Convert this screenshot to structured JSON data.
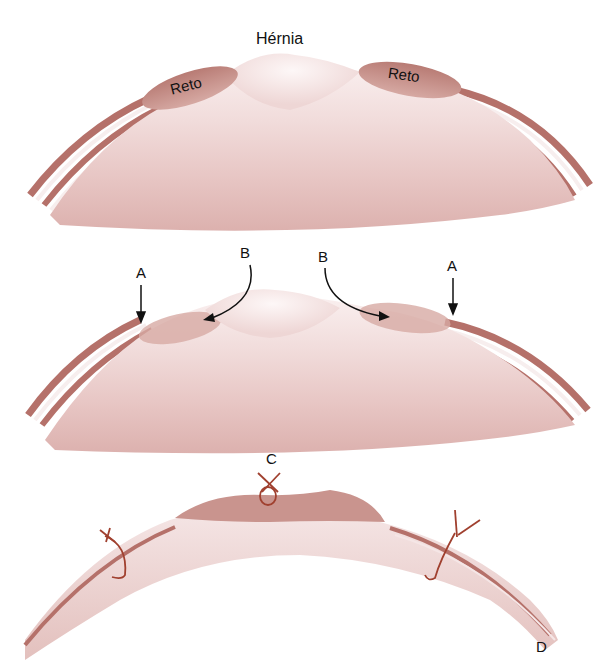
{
  "figure": {
    "panels": [
      {
        "id": "top",
        "description": "Abdominal wall cross-section with hernia between rectus muscles",
        "labels": {
          "title": "Hérnia",
          "left_muscle": "Reto",
          "right_muscle": "Reto"
        }
      },
      {
        "id": "middle",
        "description": "Incision points and rectus muscle displacement",
        "labels": {
          "arrow_left_vertical": "A",
          "arrow_left_curved": "B",
          "arrow_right_curved": "B",
          "arrow_right_vertical": "A"
        }
      },
      {
        "id": "bottom",
        "description": "Rectus muscles sutured together at midline",
        "labels": {
          "midline_suture": "C",
          "wall_end": "D"
        }
      }
    ]
  },
  "colors": {
    "tissue_light": "#f4e6e6",
    "tissue_mid": "#e6c4c2",
    "tissue_dark": "#c98f8a",
    "muscle": "#c89088",
    "fascia_stripe": "#b06a62",
    "suture": "#a0402f",
    "arrow": "#111111"
  }
}
